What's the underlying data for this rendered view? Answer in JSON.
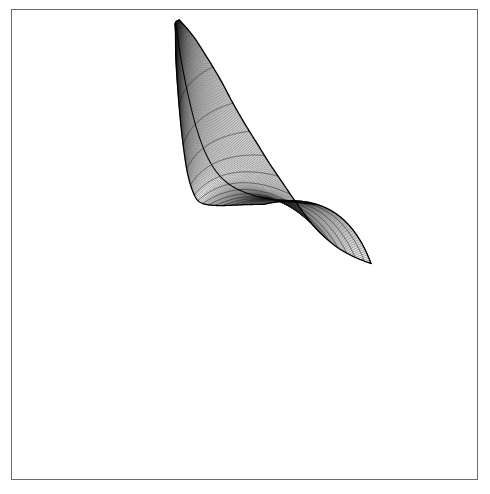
{
  "figure": {
    "title": "",
    "caption": "",
    "background_color": "#ffffff",
    "frame": {
      "visible": true,
      "color": "#6b6b6b",
      "line_width": 1,
      "x": 11,
      "y": 9,
      "width": 467,
      "height": 471
    }
  },
  "chart_data": {
    "type": "line",
    "subtype": "3d-wireframe-surface",
    "title": "",
    "subtitle": "",
    "xlabel": "",
    "ylabel": "",
    "zlabel": "",
    "legend": [],
    "legend_position": "none",
    "grid": false,
    "axes_visible": false,
    "tick_labels": [],
    "annotations": [],
    "line_color": "#1a1a1a",
    "line_width": 0.55,
    "silhouette_color": "#000000",
    "silhouette_width": 1.3,
    "surface_bbox": {
      "x_min": 134,
      "y_min": 19,
      "x_max": 347,
      "y_max": 274
    },
    "mesh": {
      "u_lines": 64,
      "v_lines": 15,
      "u_label": "length parameter",
      "v_label": "width parameter"
    },
    "spine": {
      "comment": "centerline of the ribbon in screen pixels, from top apex to lower-right fold end",
      "points": [
        [
          176,
          22
        ],
        [
          181,
          46
        ],
        [
          187,
          72
        ],
        [
          194,
          98
        ],
        [
          202,
          124
        ],
        [
          212,
          148
        ],
        [
          225,
          169
        ],
        [
          242,
          185
        ],
        [
          263,
          196
        ],
        [
          286,
          203
        ],
        [
          309,
          207
        ],
        [
          330,
          210
        ]
      ]
    },
    "half_width": {
      "comment": "perpendicular half-width of the ribbon at each spine station, pixels",
      "values": [
        3,
        14,
        22,
        28,
        32,
        36,
        40,
        46,
        52,
        57,
        60,
        62
      ]
    },
    "twist_deg": {
      "comment": "in-plane rotation of the cross-section at each spine station, degrees",
      "values": [
        -62,
        -60,
        -57,
        -52,
        -45,
        -36,
        -24,
        -10,
        2,
        10,
        15,
        18
      ]
    },
    "fold_curvature": {
      "comment": "transverse bow (sag) of each cross-section arc, pixels",
      "values": [
        2,
        5,
        8,
        11,
        14,
        18,
        24,
        32,
        40,
        46,
        50,
        52
      ]
    },
    "foreshortening": {
      "comment": "relative spacing of u-lines along the spine; small near the top apex (compressed) and large at the fold (open grid)",
      "values": [
        0.12,
        0.16,
        0.22,
        0.3,
        0.4,
        0.52,
        0.66,
        0.8,
        0.9,
        0.96,
        1.0,
        1.0
      ]
    }
  },
  "accessibility": {
    "alt_text": "Black-and-white wireframe mesh of a smoothly folded surface on a white background inside a thin rectangular frame."
  }
}
